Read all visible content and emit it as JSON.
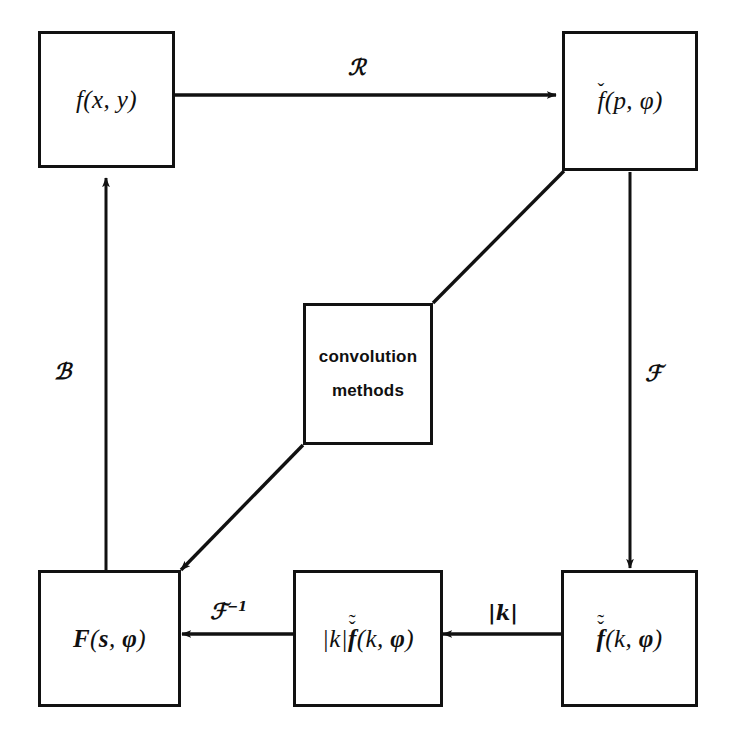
{
  "diagram": {
    "ink_color": "#111111",
    "background_color": "#ffffff",
    "nodes": [
      {
        "id": "object",
        "name": "node-f-xy",
        "label": "f(x, y)",
        "style": "math"
      },
      {
        "id": "sinogram",
        "name": "node-f-check-p-phi",
        "label": "f(p, φ)",
        "base": "f",
        "accents": [
          "caron"
        ],
        "args": "(p, φ)",
        "style": "math"
      },
      {
        "id": "convolution",
        "name": "node-convolution-methods",
        "label_line1": "convolution",
        "label_line2": "methods",
        "style": "plain"
      },
      {
        "id": "backprojected",
        "name": "node-F-s-phi",
        "label": "F(s, φ)",
        "style": "math"
      },
      {
        "id": "filtered",
        "name": "node-absk-f-tilde-check-k-phi",
        "label": "|k| f(k, φ)",
        "prefix": "|k|",
        "base": "f",
        "accents": [
          "caron",
          "tilde"
        ],
        "args": "(k, φ)",
        "style": "math"
      },
      {
        "id": "fourier",
        "name": "node-f-tilde-check-k-phi",
        "label": "f(k, φ)",
        "base": "f",
        "accents": [
          "caron",
          "tilde"
        ],
        "args": "(k, φ)",
        "style": "math"
      }
    ],
    "edges": [
      {
        "id": "radon",
        "name": "edge-label-radon",
        "from": "object",
        "to": "sinogram",
        "label": "ℛ",
        "meaning": "Radon transform"
      },
      {
        "id": "backprojection",
        "name": "edge-label-backprojection",
        "from": "backprojected",
        "to": "object",
        "label": "ℬ",
        "meaning": "backprojection"
      },
      {
        "id": "fourier-forward",
        "name": "edge-label-fourier",
        "from": "sinogram",
        "to": "fourier",
        "label": "ℱ",
        "meaning": "Fourier transform"
      },
      {
        "id": "ramp-filter",
        "name": "edge-label-ramp-filter",
        "from": "fourier",
        "to": "filtered",
        "label": "|k|",
        "meaning": "ramp filter"
      },
      {
        "id": "inverse-fourier",
        "name": "edge-label-inverse-fourier",
        "from": "filtered",
        "to": "backprojected",
        "label_main": "ℱ",
        "label_sup": "−1",
        "meaning": "inverse Fourier transform"
      },
      {
        "id": "conv-up",
        "name": "edge-convolution-to-sinogram",
        "from": "convolution",
        "to": "sinogram",
        "label": ""
      },
      {
        "id": "conv-down",
        "name": "edge-convolution-to-backprojected",
        "from": "convolution",
        "to": "backprojected",
        "label": ""
      }
    ],
    "accent_glyphs": {
      "caron": "ˇ",
      "tilde": "˜"
    }
  }
}
